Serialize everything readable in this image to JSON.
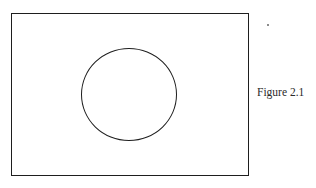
{
  "figure": {
    "caption": "Figure 2.1",
    "shapes": [
      {
        "type": "rectangle",
        "description": "outer rectangular frame"
      },
      {
        "type": "circle",
        "description": "circle centered within the rectangle"
      }
    ],
    "stroke_color": "#1e1e1e",
    "background_color": "#ffffff"
  }
}
